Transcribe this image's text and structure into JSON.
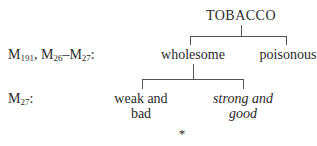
{
  "diagram": {
    "root": "TOBACCO",
    "levels": [
      {
        "label_parts": [
          {
            "base": "M",
            "sub": "191"
          },
          {
            "sep": ", "
          },
          {
            "base": "M",
            "sub": "26"
          },
          {
            "sep": "–"
          },
          {
            "base": "M",
            "sub": "27"
          },
          {
            "sep": ":"
          }
        ],
        "nodes": [
          "wholesome",
          "poisonous"
        ]
      },
      {
        "label_parts": [
          {
            "base": "M",
            "sub": "27"
          },
          {
            "sep": ":"
          }
        ],
        "nodes": [
          {
            "line1": "weak and",
            "line2": "bad",
            "italic": false
          },
          {
            "line1": "strong and",
            "line2": "good",
            "italic": true
          }
        ]
      }
    ],
    "footer_mark": "*",
    "line_color": "#555555",
    "text_color": "#2a2a2a"
  }
}
